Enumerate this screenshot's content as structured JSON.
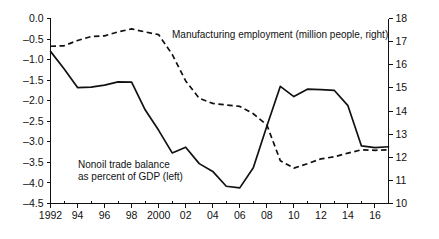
{
  "chart_data": {
    "type": "line",
    "title": "",
    "xlabel": "",
    "grid": false,
    "legend_position": "inline-annotations",
    "x": [
      1992,
      1993,
      1994,
      1995,
      1996,
      1997,
      1998,
      1999,
      2000,
      2001,
      2002,
      2003,
      2004,
      2005,
      2006,
      2007,
      2008,
      2009,
      2010,
      2011,
      2012,
      2013,
      2014,
      2015,
      2016,
      2017
    ],
    "xlim": [
      1992,
      2017
    ],
    "x_tick_labels": [
      "1992",
      "94",
      "96",
      "98",
      "2000",
      "02",
      "04",
      "06",
      "08",
      "10",
      "12",
      "14",
      "16"
    ],
    "x_tick_values": [
      1992,
      1994,
      1996,
      1998,
      2000,
      2002,
      2004,
      2006,
      2008,
      2010,
      2012,
      2014,
      2016
    ],
    "x_minor_interval": 1,
    "left_axis": {
      "label": "Nonoil trade balance as percent of GDP (left)",
      "ylim": [
        -4.5,
        0.0
      ],
      "tick_labels": [
        "0.0",
        "-0.5",
        "-1.0",
        "-1.5",
        "-2.0",
        "-2.5",
        "-3.0",
        "-3.5",
        "-4.0",
        "-4.5"
      ],
      "tick_values": [
        0.0,
        -0.5,
        -1.0,
        -1.5,
        -2.0,
        -2.5,
        -3.0,
        -3.5,
        -4.0,
        -4.5
      ]
    },
    "right_axis": {
      "label": "Manufacturing employment (million people, right)",
      "ylim": [
        10,
        18
      ],
      "tick_labels": [
        "18",
        "17",
        "16",
        "15",
        "14",
        "13",
        "12",
        "11",
        "10"
      ],
      "tick_values": [
        18,
        17,
        16,
        15,
        14,
        13,
        12,
        11,
        10
      ]
    },
    "series": [
      {
        "name": "Nonoil trade balance as percent of GDP",
        "axis": "left",
        "style": "solid",
        "color": "#111111",
        "values": [
          -0.8,
          -1.22,
          -1.68,
          -1.67,
          -1.62,
          -1.54,
          -1.55,
          -2.22,
          -2.72,
          -3.27,
          -3.13,
          -3.53,
          -3.72,
          -4.08,
          -4.12,
          -3.63,
          -2.62,
          -1.65,
          -1.9,
          -1.72,
          -1.73,
          -1.75,
          -2.12,
          -3.1,
          -3.14,
          -3.12
        ]
      },
      {
        "name": "Manufacturing employment (million people)",
        "axis": "right",
        "style": "dashed",
        "color": "#111111",
        "values": [
          16.8,
          16.82,
          17.05,
          17.22,
          17.25,
          17.42,
          17.55,
          17.42,
          17.3,
          16.45,
          15.3,
          14.55,
          14.33,
          14.26,
          14.2,
          13.88,
          13.4,
          11.85,
          11.53,
          11.72,
          11.93,
          12.02,
          12.18,
          12.32,
          12.3,
          12.32
        ]
      }
    ],
    "annotations": [
      {
        "name": "manufacturing-employment-label",
        "text": "Manufacturing employment (million people, right)",
        "x_px": 172,
        "y_px": 38
      },
      {
        "name": "nonoil-trade-balance-label-line1",
        "text": "Nonoil trade balance",
        "x_px": 78,
        "y_px": 168
      },
      {
        "name": "nonoil-trade-balance-label-line2",
        "text": "as percent of GDP (left)",
        "x_px": 78,
        "y_px": 180
      }
    ]
  }
}
